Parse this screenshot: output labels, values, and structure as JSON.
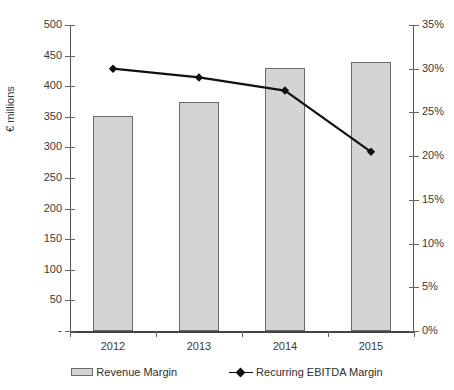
{
  "chart_data": {
    "type": "bar",
    "title": "",
    "subtitle": "",
    "categories": [
      "2012",
      "2013",
      "2014",
      "2015"
    ],
    "xlabel": "",
    "ylabel": "€ millions",
    "ylabel_right": "",
    "ylim": [
      0,
      500
    ],
    "ylim_right": [
      0,
      0.35
    ],
    "grid": false,
    "legend_position": "bottom",
    "series": [
      {
        "name": "Revenue Margin",
        "type": "bar",
        "axis": "left",
        "color": "#d4d4d4",
        "edge_color": "#6b6b6b",
        "values": [
          352,
          374,
          430,
          440
        ]
      },
      {
        "name": "Recurring EBITDA Margin",
        "type": "line",
        "axis": "right",
        "color": "#111111",
        "marker": "diamond",
        "values": [
          0.3,
          0.29,
          0.275,
          0.205
        ],
        "value_labels": [
          "30%",
          "29%",
          "27.5%",
          "20.5%"
        ]
      }
    ],
    "y_ticks_left": [
      "500",
      "450",
      "400",
      "350",
      "300",
      "250",
      "200",
      "150",
      "100",
      "50",
      "-"
    ],
    "y_tick_values_left": [
      500,
      450,
      400,
      350,
      300,
      250,
      200,
      150,
      100,
      50,
      0
    ],
    "y_ticks_right": [
      "35%",
      "30%",
      "25%",
      "20%",
      "15%",
      "10%",
      "5%",
      "0%"
    ],
    "y_tick_values_right": [
      0.35,
      0.3,
      0.25,
      0.2,
      0.15,
      0.1,
      0.05,
      0.0
    ]
  },
  "legend": {
    "items": [
      {
        "label": "Revenue Margin"
      },
      {
        "label": "Recurring EBITDA Margin"
      }
    ]
  }
}
